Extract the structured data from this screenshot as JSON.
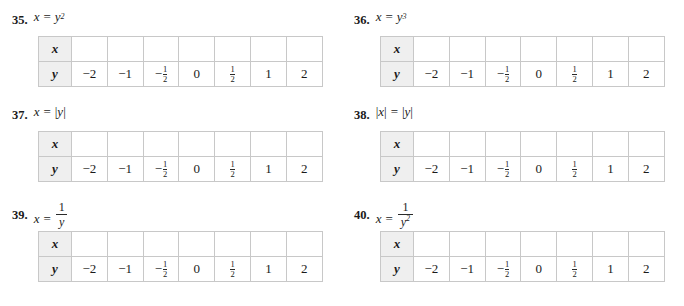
{
  "page": {
    "columns": 2,
    "rows": 3,
    "background": "#ffffff",
    "text_color": "#1a1a1a",
    "table_border_color": "#c8c8c8",
    "label_cell_background": "#efefef"
  },
  "table_template": {
    "row_labels": [
      "x",
      "y"
    ],
    "x_values": [
      "",
      "",
      "",
      "",
      "",
      "",
      ""
    ],
    "y_values": [
      "−2",
      "−1",
      "-1/2",
      "0",
      "1/2",
      "1",
      "2"
    ],
    "y_values_display": [
      {
        "type": "plain",
        "text": "−2"
      },
      {
        "type": "plain",
        "text": "−1"
      },
      {
        "type": "fraction",
        "sign": "−",
        "numerator": "1",
        "denominator": "2"
      },
      {
        "type": "plain",
        "text": "0"
      },
      {
        "type": "fraction",
        "sign": "",
        "numerator": "1",
        "denominator": "2"
      },
      {
        "type": "plain",
        "text": "1"
      },
      {
        "type": "plain",
        "text": "2"
      }
    ]
  },
  "problems": [
    {
      "number": "35.",
      "equation_plain": "x = y²",
      "lhs": "x",
      "operator": "=",
      "rhs_base": "y",
      "rhs_exponent": "2",
      "rhs_type": "power"
    },
    {
      "number": "36.",
      "equation_plain": "x = y³",
      "lhs": "x",
      "operator": "=",
      "rhs_base": "y",
      "rhs_exponent": "3",
      "rhs_type": "power"
    },
    {
      "number": "37.",
      "equation_plain": "x = |y|",
      "lhs": "x",
      "operator": "=",
      "rhs_base": "y",
      "rhs_exponent": "",
      "rhs_type": "absolute"
    },
    {
      "number": "38.",
      "equation_plain": "|x| = |y|",
      "lhs": "x",
      "operator": "=",
      "rhs_base": "y",
      "rhs_exponent": "",
      "rhs_type": "absolute_both"
    },
    {
      "number": "39.",
      "equation_plain": "x = 1/y",
      "lhs": "x",
      "operator": "=",
      "rhs_numerator": "1",
      "rhs_denominator": "y",
      "rhs_denominator_exponent": "",
      "rhs_type": "fraction"
    },
    {
      "number": "40.",
      "equation_plain": "x = 1/y²",
      "lhs": "x",
      "operator": "=",
      "rhs_numerator": "1",
      "rhs_denominator": "y",
      "rhs_denominator_exponent": "2",
      "rhs_type": "fraction"
    }
  ]
}
